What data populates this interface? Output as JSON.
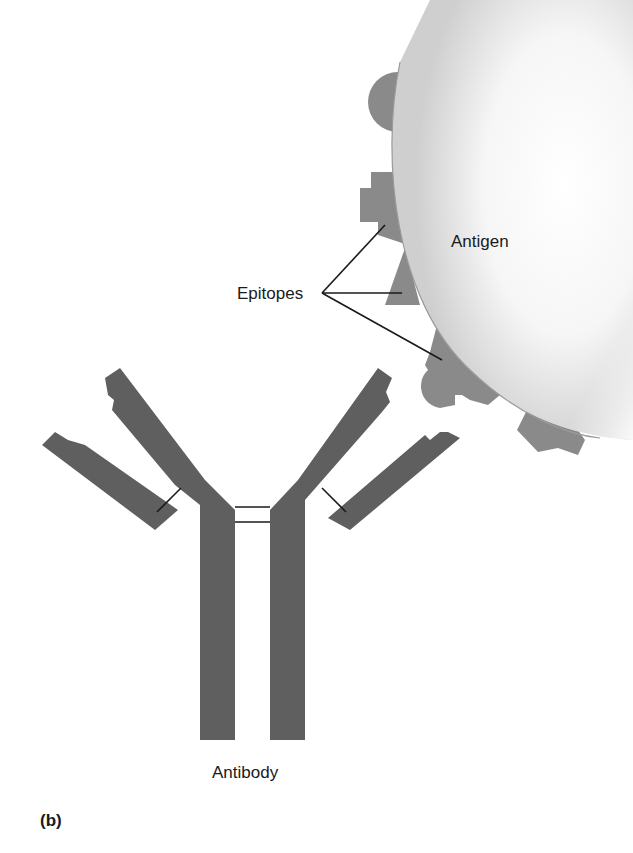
{
  "figure": {
    "panel_label": "(b)",
    "labels": {
      "antigen": "Antigen",
      "epitopes": "Epitopes",
      "antibody": "Antibody"
    },
    "colors": {
      "antibody_fill": "#5f5f5f",
      "epitope_fill": "#8a8a8a",
      "antigen_fill_light": "#ffffff",
      "antigen_fill_dark": "#cfcfcf",
      "leader_line": "#1a1a1a",
      "background": "#ffffff"
    },
    "epitope_pointer_count": 3,
    "disulfide_bonds_hinge": 2
  }
}
